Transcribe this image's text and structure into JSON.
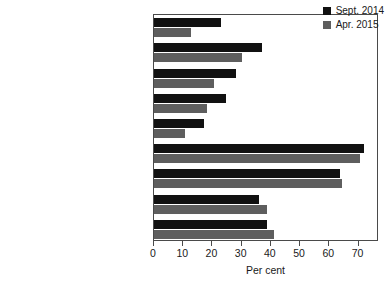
{
  "chart_data": {
    "type": "bar",
    "orientation": "horizontal",
    "title": "",
    "xlabel": "Per cent",
    "ylabel": "",
    "xlim": [
      0,
      77
    ],
    "ylim": null,
    "grid": false,
    "legend_position": "top-right",
    "xticks": [
      0,
      10,
      20,
      30,
      40,
      50,
      60,
      70
    ],
    "xticklabels": [
      "0",
      "10",
      "20",
      "30",
      "40",
      "50",
      "60",
      "70"
    ],
    "categories": [
      "Keeps promises",
      "Understands Britain's problems",
      "Looks after people like me",
      "Good team of leaders",
      "Fit to govern",
      "Different from other parties",
      "Extreme",
      "Divided",
      "Out of date"
    ],
    "series": [
      {
        "name": "Sept. 2014",
        "color": "#111111",
        "values": [
          23,
          37,
          28,
          24.5,
          17,
          72,
          63.5,
          36,
          38.5
        ]
      },
      {
        "name": "Apr. 2015",
        "color": "#5e5e5e",
        "values": [
          12.5,
          30,
          20.5,
          18,
          10.5,
          70.5,
          64.5,
          38.5,
          41
        ]
      }
    ]
  },
  "legend": {
    "items": [
      {
        "label": "Sept. 2014",
        "color": "#111111"
      },
      {
        "label": "Apr. 2015",
        "color": "#5e5e5e"
      }
    ]
  },
  "axis": {
    "x_title": "Per cent"
  }
}
